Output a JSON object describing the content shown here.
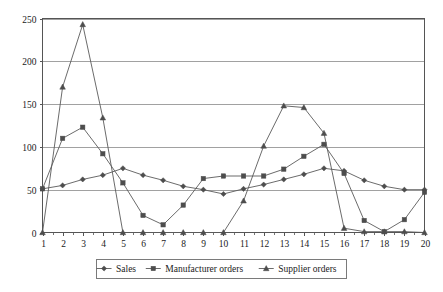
{
  "chart_data": {
    "type": "line",
    "title": "",
    "subtitle": "",
    "xlabel": "",
    "ylabel": "",
    "xlim": [
      1,
      20
    ],
    "ylim": [
      0,
      250
    ],
    "grid": "horizontal",
    "legend_position": "bottom",
    "categories": [
      "1",
      "2",
      "3",
      "4",
      "5",
      "6",
      "7",
      "8",
      "9",
      "10",
      "11",
      "12",
      "13",
      "14",
      "15",
      "16",
      "17",
      "18",
      "19",
      "20"
    ],
    "x": [
      1,
      2,
      3,
      4,
      5,
      6,
      7,
      8,
      9,
      10,
      11,
      12,
      13,
      14,
      15,
      16,
      17,
      18,
      19,
      20
    ],
    "y_ticks": [
      0,
      50,
      100,
      150,
      200,
      250
    ],
    "x_ticks": [
      1,
      2,
      3,
      4,
      5,
      6,
      7,
      8,
      9,
      10,
      11,
      12,
      13,
      14,
      15,
      16,
      17,
      18,
      19,
      20
    ],
    "series": [
      {
        "name": "Sales",
        "marker": "diamond",
        "values": [
          51,
          55,
          62,
          67,
          75,
          67,
          61,
          54,
          50,
          45,
          51,
          56,
          62,
          68,
          75,
          72,
          61,
          54,
          50,
          50
        ]
      },
      {
        "name": "Manufacturer orders",
        "marker": "square",
        "values": [
          51,
          110,
          123,
          92,
          58,
          20,
          9,
          32,
          63,
          66,
          66,
          66,
          74,
          89,
          103,
          69,
          14,
          1,
          15,
          47
        ]
      },
      {
        "name": "Supplier orders",
        "marker": "triangle",
        "values": [
          0,
          170,
          243,
          134,
          0,
          0,
          0,
          0,
          0,
          0,
          37,
          101,
          148,
          146,
          116,
          5,
          1,
          1,
          1,
          0
        ]
      }
    ]
  },
  "legend": {
    "items": [
      {
        "label": "Sales"
      },
      {
        "label": "Manufacturer orders"
      },
      {
        "label": "Supplier orders"
      }
    ]
  },
  "colors": {
    "line": "#5a5a5a",
    "marker": "#4d4d4d",
    "grid": "#8a8a8a",
    "axis": "#555555",
    "text": "#1a1a1a",
    "background": "#ffffff"
  }
}
